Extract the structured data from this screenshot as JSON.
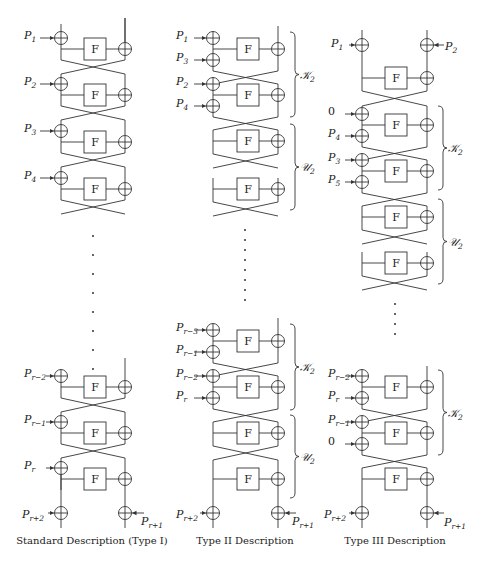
{
  "figure": {
    "block_label": "F",
    "columns": [
      {
        "id": "type1",
        "caption": "Standard Description (Type I)",
        "top_inputs": [
          "P1",
          "P2",
          "P3",
          "P4"
        ],
        "bottom_inputs": [
          "Pr-2",
          "Pr-1",
          "Pr"
        ],
        "final_left": "Pr+2",
        "final_right": "Pr+1"
      },
      {
        "id": "type2",
        "caption": "Type II Description",
        "top_inputs": [
          "P1",
          "P3",
          "P2",
          "P4"
        ],
        "bottom_inputs": [
          "Pr-3",
          "Pr-1",
          "Pr-2",
          "Pr"
        ],
        "braces": [
          "K2",
          "U2",
          "K2",
          "U2"
        ],
        "final_left": "Pr+2",
        "final_right": "Pr+1"
      },
      {
        "id": "type3",
        "caption": "Type III Description",
        "top_left_input": "P1",
        "top_right_input": "P2",
        "top_inputs": [
          "0",
          "P4",
          "P3",
          "P5"
        ],
        "bottom_inputs": [
          "Pr-2",
          "Pr",
          "Pr-1",
          "0"
        ],
        "braces": [
          "K2",
          "U2",
          "K2"
        ],
        "final_left": "Pr+2",
        "final_right": "Pr+1"
      }
    ],
    "brace_labels": {
      "K2": "𝒦",
      "U2": "𝒰",
      "sub": "2"
    }
  }
}
